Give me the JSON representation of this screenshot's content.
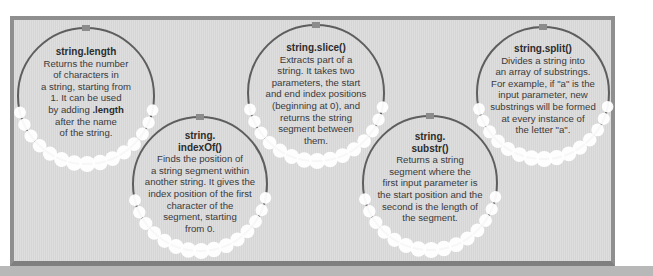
{
  "diagram": {
    "colors": {
      "frame_border": "#8f8f8f",
      "frame_fill": "#dadada",
      "circle_stroke": "#5e5e5e",
      "connector": "#8c8c8c",
      "beads": "#ffffff",
      "text": "#3a3a3a"
    },
    "methods": [
      {
        "title": "string.length",
        "lines": [
          "Returns the number",
          "of characters in",
          "a string, starting from",
          "1. It can be used"
        ],
        "line_adding_prefix": "by adding ",
        "line_adding_bold": ".length",
        "lines_after": [
          "after the name",
          "of the string."
        ]
      },
      {
        "title_line1": "string.",
        "title_line2": "indexOf()",
        "lines": [
          "Finds the position of",
          "a string segment within",
          "another string. It gives the",
          "index position of the first",
          "character of the",
          "segment, starting",
          "from 0."
        ]
      },
      {
        "title": "string.slice()",
        "lines": [
          "Extracts part of a",
          "string. It takes two",
          "parameters, the start",
          "and end index positions",
          "(beginning at 0), and",
          "returns the string",
          "segment between",
          "them."
        ]
      },
      {
        "title_line1": "string.",
        "title_line2": "substr()",
        "lines": [
          "Returns a string",
          "segment where the",
          "first input parameter is",
          "the start position and the",
          "second is the length of",
          "the segment."
        ]
      },
      {
        "title": "string.split()",
        "lines": [
          "Divides a string into",
          "an array of substrings.",
          "For example, if \"a\" is the",
          "input parameter, new",
          "substrings will be formed",
          "at every instance of",
          "the letter \"a\"."
        ]
      }
    ]
  }
}
